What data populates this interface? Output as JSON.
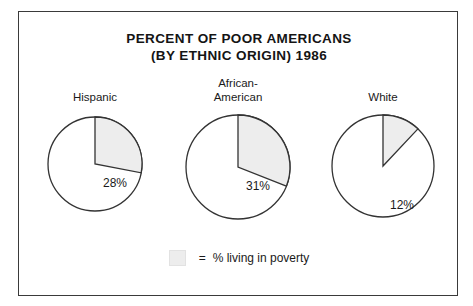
{
  "title": {
    "line1": "PERCENT OF POOR AMERICANS",
    "line2": "(BY ETHNIC ORIGIN) 1986"
  },
  "legend": {
    "equals": "=",
    "text": "% living in poverty",
    "swatch_color": "#ededed"
  },
  "colors": {
    "wedge_fill": "#ededed",
    "outline": "#333333",
    "frame": "#3a3a3a",
    "background": "#ffffff",
    "text": "#1a1a1a"
  },
  "chart_data": {
    "type": "pie",
    "title": "PERCENT OF POOR AMERICANS (BY ETHNIC ORIGIN) 1986",
    "subtitle": "",
    "xlabel": "",
    "ylabel": "",
    "legend_position": "bottom",
    "grid": false,
    "note": "Three separate pie charts; each shaded wedge shows the percent of that group living in poverty in 1986.",
    "categories": [
      "Hispanic",
      "African-American",
      "White"
    ],
    "values": [
      28,
      31,
      12
    ],
    "value_labels": [
      "28%",
      "31%",
      "12%"
    ],
    "pies": [
      {
        "label_lines": [
          "Hispanic"
        ],
        "value": 28,
        "value_label": "28%",
        "radius": 47,
        "start_angle_deg": 270,
        "sweep_deg": 100.8,
        "label_x": 20,
        "label_y": 20
      },
      {
        "label_lines": [
          "African-",
          "American"
        ],
        "value": 31,
        "value_label": "31%",
        "radius": 52,
        "start_angle_deg": 270,
        "sweep_deg": 111.6,
        "label_x": 20,
        "label_y": 20
      },
      {
        "label_lines": [
          "White"
        ],
        "value": 12,
        "value_label": "12%",
        "radius": 51,
        "start_angle_deg": 270,
        "sweep_deg": 43.2,
        "label_x": 19,
        "label_y": 40
      }
    ]
  }
}
